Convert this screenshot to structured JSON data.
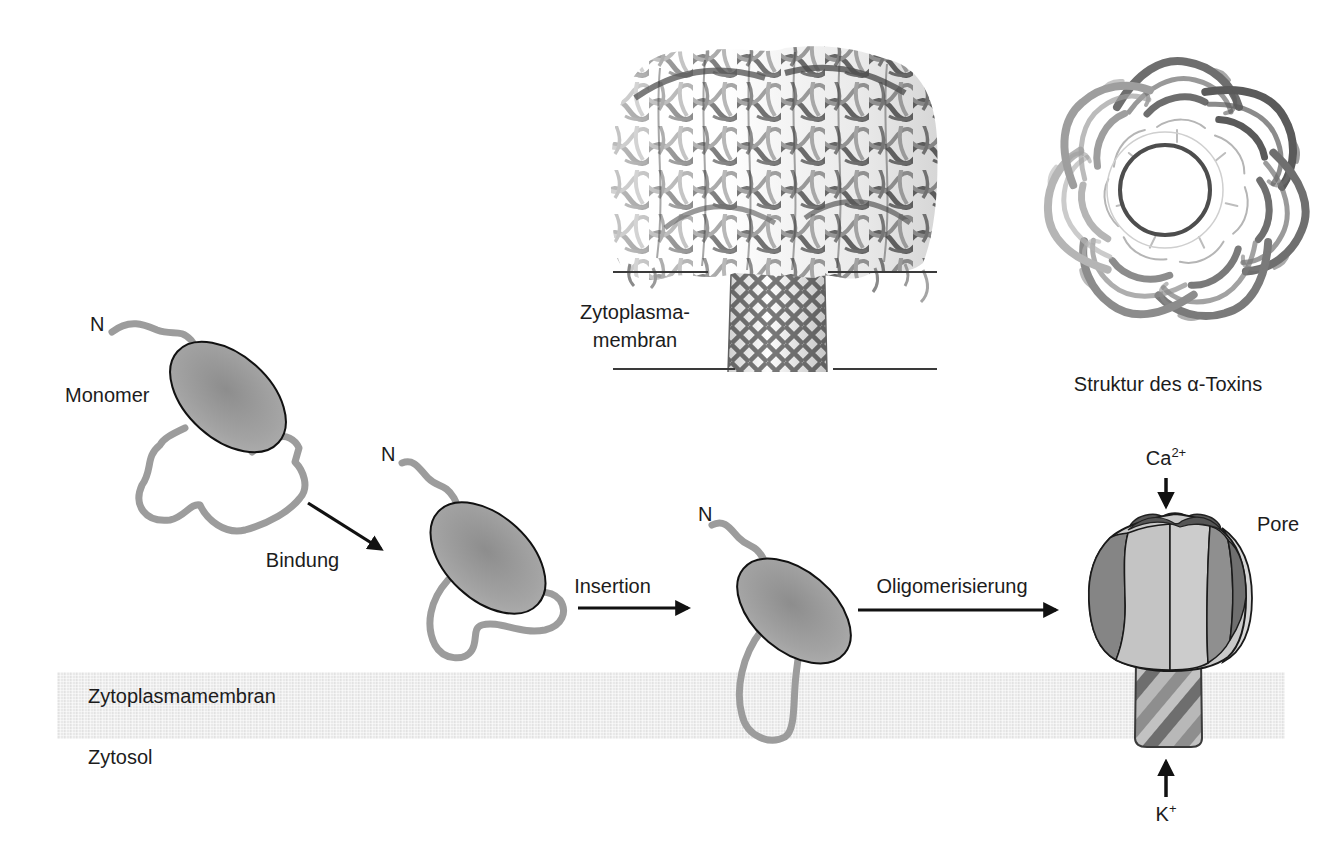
{
  "colors": {
    "background": "#ffffff",
    "text": "#1c1c1c",
    "membrane_fill": "#e9e9e9",
    "strand_gray": "#9c9c9c",
    "monomer_body_gray": "#a0a0a0",
    "arrow_black": "#111111",
    "pore_dark_segment": "#858585",
    "pore_light_segment": "#c9c9c9"
  },
  "top_left_figure": {
    "membrane_label_line1": "Zytoplasma-",
    "membrane_label_line2": "membran"
  },
  "top_right_figure": {
    "caption": "Struktur des α-Toxins"
  },
  "pathway": {
    "n_terminus_label": "N",
    "monomer_label": "Monomer",
    "steps": {
      "binding": "Bindung",
      "insertion": "Insertion",
      "oligomerization": "Oligomerisierung"
    },
    "pore_label": "Pore",
    "calcium": {
      "symbol": "Ca",
      "charge": "2+"
    },
    "potassium": {
      "symbol": "K",
      "charge": "+"
    }
  },
  "membrane": {
    "label": "Zytoplasmamembran",
    "cytosol_label": "Zytosol"
  }
}
